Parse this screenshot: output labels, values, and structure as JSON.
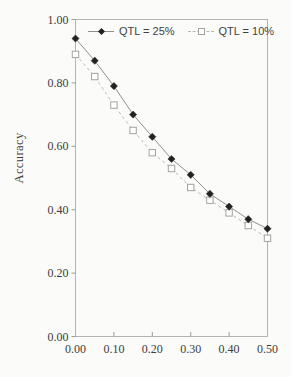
{
  "figure": {
    "background": "#fbfbf9"
  },
  "chart_data": {
    "type": "line",
    "title": "",
    "xlabel": "",
    "ylabel": "Accuracy",
    "xlim": [
      0.0,
      0.5
    ],
    "ylim": [
      0.0,
      1.0
    ],
    "grid": false,
    "legend_position": "top-inside",
    "frame_color": "#b3b3b3",
    "tick_color": "#9a9a9a",
    "tick_text_color": "#3c3c3c",
    "x": [
      0.0,
      0.05,
      0.1,
      0.15,
      0.2,
      0.25,
      0.3,
      0.35,
      0.4,
      0.45,
      0.5
    ],
    "xtick_values": [
      0.0,
      0.1,
      0.2,
      0.3,
      0.4,
      0.5
    ],
    "xtick_labels": [
      "0.00",
      "0.10",
      "0.20",
      "0.30",
      "0.40",
      "0.50"
    ],
    "ytick_values": [
      0.0,
      0.2,
      0.4,
      0.6,
      0.8,
      1.0
    ],
    "ytick_labels": [
      "0.00",
      "0.20",
      "0.40",
      "0.60",
      "0.80",
      "1.00"
    ],
    "series": [
      {
        "name": "QTL = 25%",
        "marker": "filled-diamond",
        "line_style": "solid",
        "marker_color": "#222222",
        "line_color": "#8f8f8f",
        "values": [
          0.94,
          0.87,
          0.79,
          0.7,
          0.63,
          0.56,
          0.51,
          0.45,
          0.41,
          0.37,
          0.34
        ]
      },
      {
        "name": "QTL = 10%",
        "marker": "open-square",
        "line_style": "dashed",
        "marker_color": "#a3a3a3",
        "line_color": "#b8b8b8",
        "values": [
          0.89,
          0.82,
          0.73,
          0.65,
          0.58,
          0.53,
          0.47,
          0.43,
          0.39,
          0.35,
          0.31
        ]
      }
    ]
  }
}
